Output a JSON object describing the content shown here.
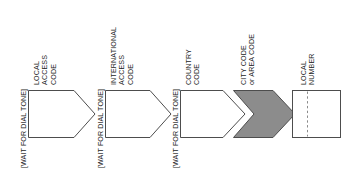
{
  "diagram": {
    "type": "flow-sequence",
    "colors": {
      "stroke": "#4d4d4d",
      "fill_plain": "#ffffff",
      "fill_highlight": "#8c8c8c",
      "text": "#1c1c1c",
      "background": "#ffffff"
    },
    "steps": [
      {
        "id": "local-access-code",
        "shape": "pentagon-arrow",
        "highlighted": false,
        "wait_label": "[WAIT FOR DIAL TONE]",
        "has_wait_label": true,
        "label_lines": [
          "LOCAL",
          "ACCESS",
          "CODE"
        ]
      },
      {
        "id": "international-access-code",
        "shape": "pentagon-arrow",
        "highlighted": false,
        "wait_label": "[WAIT FOR DIAL TONE]",
        "has_wait_label": true,
        "label_lines": [
          "INTERNATIONAL",
          "ACCESS",
          "CODE"
        ]
      },
      {
        "id": "country-code",
        "shape": "pentagon-arrow",
        "highlighted": false,
        "wait_label": "[WAIT FOR DIAL TONE]",
        "has_wait_label": true,
        "label_lines": [
          "COUNTRY",
          "CODE"
        ]
      },
      {
        "id": "city-or-area-code",
        "shape": "chevron-arrow",
        "highlighted": true,
        "wait_label": "",
        "has_wait_label": false,
        "label_lines": [
          "CITY CODE",
          "or AREA CODE"
        ]
      },
      {
        "id": "local-number",
        "shape": "rectangle-dashed-split",
        "highlighted": false,
        "wait_label": "",
        "has_wait_label": false,
        "label_lines": [
          "LOCAL",
          "NUMBER"
        ]
      }
    ]
  }
}
